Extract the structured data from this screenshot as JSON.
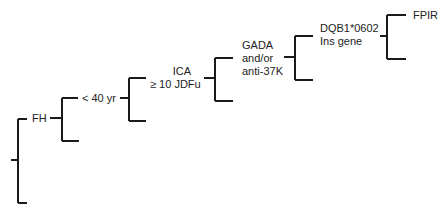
{
  "diagram": {
    "type": "staircase-tree",
    "nodes": [
      {
        "id": "fh",
        "label": "FH"
      },
      {
        "id": "age",
        "label": "< 40 yr"
      },
      {
        "id": "ica",
        "label_line1": "ICA",
        "label_line2": "≥ 10 JDFu"
      },
      {
        "id": "gada",
        "label_line1": "GADA",
        "label_line2": "and/or",
        "label_line3": "anti-37K"
      },
      {
        "id": "dqb1",
        "label_line1": "DQB1*0602",
        "label_line2": "Ins gene"
      },
      {
        "id": "fpir",
        "label": "FPIR"
      }
    ],
    "line_color": "#1a1a1a"
  }
}
